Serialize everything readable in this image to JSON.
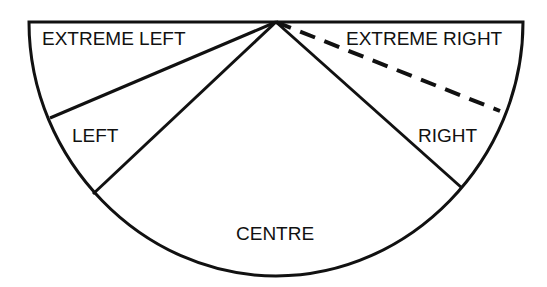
{
  "diagram": {
    "type": "semicircular-segments",
    "labels": {
      "extreme_left": "EXTREME LEFT",
      "left": "LEFT",
      "centre": "CENTRE",
      "right": "RIGHT",
      "extreme_right": "EXTREME RIGHT"
    },
    "line_color": "#111111",
    "background": "#ffffff",
    "dashed_boundary": "between RIGHT and EXTREME RIGHT"
  }
}
